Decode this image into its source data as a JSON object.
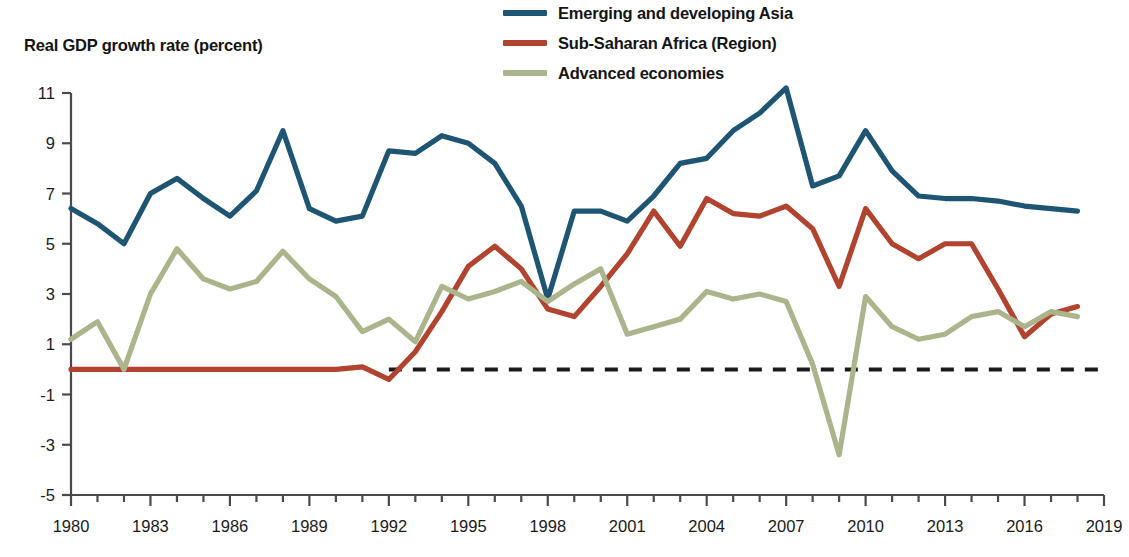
{
  "figure": {
    "y_axis_title": "Real GDP growth rate (percent)",
    "background": "#ffffff"
  },
  "legend": {
    "position": "top-center-right",
    "items": [
      {
        "label": "Emerging and developing Asia",
        "color": "#1d5573",
        "key": "emerging-developing-asia"
      },
      {
        "label": "Sub-Saharan Africa (Region)",
        "color": "#b1432f",
        "key": "sub-saharan-africa"
      },
      {
        "label": "Advanced economies",
        "color": "#abb58c",
        "key": "advanced-economies"
      }
    ]
  },
  "axes": {
    "y_ticks": [
      "11",
      "9",
      "7",
      "5",
      "3",
      "1",
      "-1",
      "-3",
      "-5"
    ],
    "y_tick_values": [
      11,
      9,
      7,
      5,
      3,
      1,
      -1,
      -3,
      -5
    ],
    "x_ticks": [
      "1980",
      "1983",
      "1986",
      "1989",
      "1992",
      "1995",
      "1998",
      "2001",
      "2004",
      "2007",
      "2010",
      "2013",
      "2016",
      "2019"
    ],
    "x_tick_values": [
      1980,
      1983,
      1986,
      1989,
      1992,
      1995,
      1998,
      2001,
      2004,
      2007,
      2010,
      2013,
      2016,
      2019
    ],
    "zero_reference_line": {
      "value": 0,
      "style": "dashed",
      "color": "#1a1a1a",
      "start_year": 1992,
      "end_year": 2019
    }
  },
  "chart_data": {
    "type": "line",
    "title": "",
    "subtitle": "",
    "xlabel": "",
    "ylabel": "Real GDP growth rate (percent)",
    "xlim": [
      1980,
      2019
    ],
    "ylim": [
      -5,
      11
    ],
    "grid": false,
    "legend_position": "top",
    "x": [
      1980,
      1981,
      1982,
      1983,
      1984,
      1985,
      1986,
      1987,
      1988,
      1989,
      1990,
      1991,
      1992,
      1993,
      1994,
      1995,
      1996,
      1997,
      1998,
      1999,
      2000,
      2001,
      2002,
      2003,
      2004,
      2005,
      2006,
      2007,
      2008,
      2009,
      2010,
      2011,
      2012,
      2013,
      2014,
      2015,
      2016,
      2017,
      2018
    ],
    "series": [
      {
        "name": "Emerging and developing Asia",
        "color": "#1d5573",
        "values": [
          6.4,
          5.8,
          5.0,
          7.0,
          7.6,
          6.8,
          6.1,
          7.1,
          9.5,
          6.4,
          5.9,
          6.1,
          8.7,
          8.6,
          9.3,
          9.0,
          8.2,
          6.5,
          2.8,
          6.3,
          6.3,
          5.9,
          6.9,
          8.2,
          8.4,
          9.5,
          10.2,
          11.2,
          7.3,
          7.7,
          9.5,
          7.9,
          6.9,
          6.8,
          6.8,
          6.7,
          6.5,
          6.4,
          6.3
        ]
      },
      {
        "name": "Sub-Saharan Africa (Region)",
        "color": "#b1432f",
        "values": [
          0.0,
          0.0,
          0.0,
          0.0,
          0.0,
          0.0,
          0.0,
          0.0,
          0.0,
          0.0,
          0.0,
          0.1,
          -0.4,
          0.7,
          2.3,
          4.1,
          4.9,
          4.0,
          2.4,
          2.1,
          3.3,
          4.6,
          6.3,
          4.9,
          6.8,
          6.2,
          6.1,
          6.5,
          5.6,
          3.3,
          6.4,
          5.0,
          4.4,
          5.0,
          5.0,
          3.2,
          1.3,
          2.2,
          2.5
        ]
      },
      {
        "name": "Advanced economies",
        "color": "#abb58c",
        "values": [
          1.2,
          1.9,
          0.0,
          3.0,
          4.8,
          3.6,
          3.2,
          3.5,
          4.7,
          3.6,
          2.9,
          1.5,
          2.0,
          1.1,
          3.3,
          2.8,
          3.1,
          3.5,
          2.7,
          3.4,
          4.0,
          1.4,
          1.7,
          2.0,
          3.1,
          2.8,
          3.0,
          2.7,
          0.2,
          -3.4,
          2.9,
          1.7,
          1.2,
          1.4,
          2.1,
          2.3,
          1.7,
          2.3,
          2.1
        ]
      }
    ]
  }
}
